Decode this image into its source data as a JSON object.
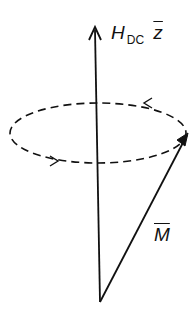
{
  "diagram": {
    "type": "precession-vector-diagram",
    "field_label": {
      "main": "H",
      "subscript": "DC",
      "unit_vector": "z"
    },
    "magnetization_label": "M",
    "elements": [
      {
        "id": "field-axis",
        "kind": "arrow",
        "from": [
          100,
          302
        ],
        "to": [
          95,
          27
        ],
        "label": "H_DC z̄"
      },
      {
        "id": "magnetization-vector",
        "kind": "arrow",
        "from": [
          100,
          302
        ],
        "to": [
          188,
          133
        ],
        "label": "M̄"
      },
      {
        "id": "precession-orbit",
        "kind": "dashed-ellipse",
        "center": [
          98,
          133
        ],
        "rx": 88,
        "ry": 30,
        "direction": "counterclockwise (as viewed)"
      }
    ],
    "colors": {
      "stroke": "#111111",
      "background": "#ffffff"
    }
  }
}
